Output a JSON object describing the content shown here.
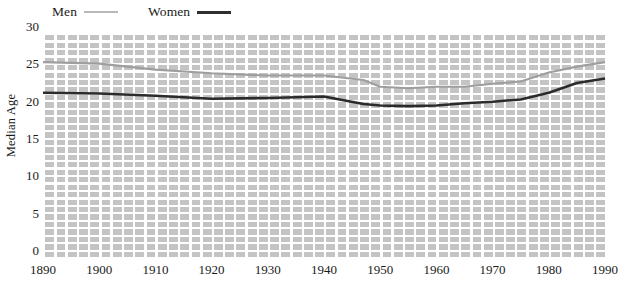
{
  "chart_data": {
    "type": "line",
    "title": "",
    "xlabel": "",
    "ylabel": "Median Age",
    "xlim": [
      1890,
      1990
    ],
    "ylim": [
      0,
      30
    ],
    "grid": true,
    "legend_position": "top-left",
    "x": [
      1890,
      1900,
      1910,
      1920,
      1930,
      1940,
      1947,
      1950,
      1955,
      1960,
      1965,
      1970,
      1975,
      1980,
      1985,
      1990
    ],
    "series": [
      {
        "name": "Men",
        "color": "#9e9e9e",
        "values": [
          26.1,
          25.9,
          25.1,
          24.6,
          24.3,
          24.3,
          23.7,
          22.8,
          22.6,
          22.8,
          22.8,
          23.2,
          23.5,
          24.7,
          25.5,
          26.1
        ]
      },
      {
        "name": "Women",
        "color": "#2b2b2b",
        "values": [
          22.0,
          21.9,
          21.6,
          21.2,
          21.3,
          21.5,
          20.5,
          20.3,
          20.2,
          20.3,
          20.6,
          20.8,
          21.1,
          22.0,
          23.3,
          23.9
        ]
      }
    ],
    "y_ticks": [
      0,
      5,
      10,
      15,
      20,
      25,
      30
    ],
    "x_ticks": [
      1890,
      1900,
      1910,
      1920,
      1930,
      1940,
      1950,
      1960,
      1970,
      1980,
      1990
    ],
    "legend": [
      {
        "label": "Men",
        "style": "men"
      },
      {
        "label": "Women",
        "style": "women"
      }
    ]
  },
  "axis": {
    "y_title": "Median Age"
  }
}
